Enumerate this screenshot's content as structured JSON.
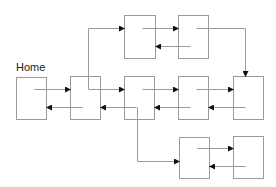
{
  "diagram": {
    "title": "Home",
    "title_pos": {
      "x": 16,
      "y": 62
    },
    "stroke_color": "#9a9a9a",
    "arrow_color": "#111111",
    "nodes": [
      {
        "id": "home",
        "x": 16,
        "y": 77,
        "w": 30,
        "h": 42
      },
      {
        "id": "n2",
        "x": 70,
        "y": 76,
        "w": 30,
        "h": 43
      },
      {
        "id": "n3",
        "x": 124,
        "y": 76,
        "w": 30,
        "h": 43
      },
      {
        "id": "n4",
        "x": 178,
        "y": 76,
        "w": 30,
        "h": 43
      },
      {
        "id": "n5",
        "x": 233,
        "y": 76,
        "w": 30,
        "h": 43
      },
      {
        "id": "top1",
        "x": 124,
        "y": 15,
        "w": 31,
        "h": 43
      },
      {
        "id": "top2",
        "x": 178,
        "y": 15,
        "w": 30,
        "h": 43
      },
      {
        "id": "bot1",
        "x": 179,
        "y": 137,
        "w": 30,
        "h": 41
      },
      {
        "id": "bot2",
        "x": 233,
        "y": 136,
        "w": 30,
        "h": 42
      }
    ],
    "edges": [
      {
        "from": "home",
        "to": "n2",
        "points": [
          [
            34,
            89
          ],
          [
            70,
            89
          ]
        ]
      },
      {
        "from": "n2",
        "to": "home",
        "points": [
          [
            82,
            107
          ],
          [
            46,
            107
          ]
        ]
      },
      {
        "from": "n2",
        "to": "n3",
        "points": [
          [
            88,
            89
          ],
          [
            124,
            89
          ]
        ]
      },
      {
        "from": "n3",
        "to": "n2",
        "points": [
          [
            136,
            107
          ],
          [
            100,
            107
          ]
        ]
      },
      {
        "from": "n2",
        "to": "top1",
        "points": [
          [
            88,
            89
          ],
          [
            88,
            28
          ],
          [
            124,
            28
          ]
        ]
      },
      {
        "from": "top1",
        "to": "top2",
        "points": [
          [
            142,
            28
          ],
          [
            178,
            28
          ]
        ]
      },
      {
        "from": "top2",
        "to": "top1",
        "points": [
          [
            190,
            46
          ],
          [
            155,
            46
          ]
        ]
      },
      {
        "from": "top2",
        "to": "n5",
        "points": [
          [
            196,
            28
          ],
          [
            245,
            28
          ],
          [
            245,
            76
          ]
        ]
      },
      {
        "from": "n3",
        "to": "n4",
        "points": [
          [
            142,
            89
          ],
          [
            178,
            89
          ]
        ]
      },
      {
        "from": "n4",
        "to": "n3",
        "points": [
          [
            190,
            107
          ],
          [
            154,
            107
          ]
        ]
      },
      {
        "from": "n4",
        "to": "n5",
        "points": [
          [
            196,
            89
          ],
          [
            233,
            89
          ]
        ]
      },
      {
        "from": "n5",
        "to": "n4",
        "points": [
          [
            245,
            107
          ],
          [
            208,
            107
          ]
        ]
      },
      {
        "from": "n3",
        "to": "bot1",
        "points": [
          [
            137,
            107
          ],
          [
            137,
            161
          ],
          [
            179,
            161
          ]
        ]
      },
      {
        "from": "bot1",
        "to": "bot2",
        "points": [
          [
            197,
            148
          ],
          [
            233,
            148
          ]
        ]
      },
      {
        "from": "bot2",
        "to": "bot1",
        "points": [
          [
            245,
            166
          ],
          [
            209,
            166
          ]
        ]
      }
    ]
  }
}
